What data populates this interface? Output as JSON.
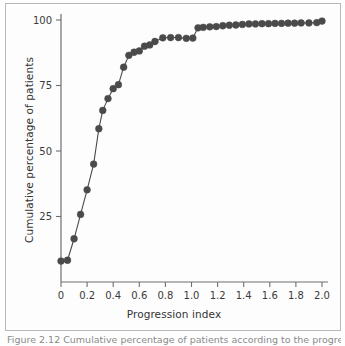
{
  "figure": {
    "caption": "Figure 2.12 Cumulative percentage of patients according to the progression index.",
    "background_color": "#fdfdfd",
    "frame_color": "#b9b9b9"
  },
  "chart_data": {
    "type": "line",
    "title": "",
    "subtitle": "",
    "xlabel": "Progression index",
    "ylabel": "Cumulative percentage of patients",
    "xlim": [
      -0.07,
      2.07
    ],
    "ylim": [
      0,
      103
    ],
    "grid": false,
    "legend": null,
    "marker": "filled-circle",
    "marker_color": "#4a4a4a",
    "line_color": "#4a4a4a",
    "line_width": 1.1,
    "marker_size": 3.4,
    "xticks": [
      0,
      0.2,
      0.4,
      0.6,
      0.8,
      1.0,
      1.2,
      1.4,
      1.6,
      1.8,
      2.0
    ],
    "xtick_labels": [
      "0",
      "0.2",
      "0.4",
      "0.6",
      "0.8",
      "1.0",
      "1.2",
      "1.4",
      "1.6",
      "1.8",
      "2.0"
    ],
    "yticks": [
      25,
      50,
      75,
      100
    ],
    "ytick_labels": [
      "25",
      "50",
      "75",
      "100"
    ],
    "series": [
      {
        "name": "Cumulative percentage of patients",
        "x": [
          0.0,
          0.05,
          0.1,
          0.15,
          0.2,
          0.25,
          0.29,
          0.32,
          0.36,
          0.4,
          0.44,
          0.48,
          0.52,
          0.56,
          0.6,
          0.64,
          0.68,
          0.72,
          0.78,
          0.84,
          0.9,
          0.96,
          1.01,
          1.05,
          1.09,
          1.14,
          1.19,
          1.24,
          1.29,
          1.34,
          1.39,
          1.44,
          1.49,
          1.54,
          1.59,
          1.64,
          1.69,
          1.74,
          1.79,
          1.84,
          1.9,
          1.96,
          2.0
        ],
        "y": [
          8.0,
          8.3,
          16.5,
          25.8,
          35.2,
          45.0,
          58.5,
          65.5,
          70.0,
          73.8,
          75.3,
          82.0,
          86.5,
          87.7,
          88.2,
          90.0,
          90.5,
          91.8,
          93.2,
          93.3,
          93.3,
          93.0,
          93.1,
          97.0,
          97.2,
          97.4,
          97.5,
          97.8,
          98.0,
          98.1,
          98.3,
          98.5,
          98.5,
          98.6,
          98.6,
          98.7,
          98.7,
          98.8,
          98.8,
          98.9,
          98.9,
          99.0,
          99.6
        ]
      }
    ]
  }
}
